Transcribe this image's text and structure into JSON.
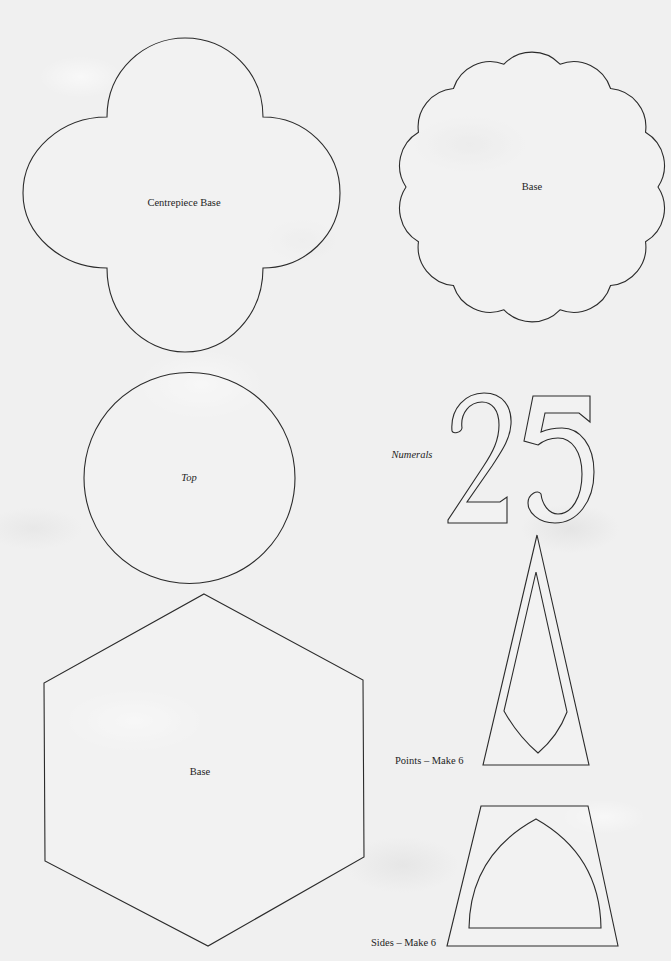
{
  "sheet": {
    "background_color": "#f0f0f0",
    "stroke_color": "#2b2b2b",
    "templates": [
      {
        "id": "centrepiece-base",
        "shape": "quatrefoil",
        "label": "Centrepiece Base"
      },
      {
        "id": "scalloped-base",
        "shape": "scalloped-circle",
        "scallops": 14,
        "label": "Base"
      },
      {
        "id": "top",
        "shape": "circle",
        "label": "Top"
      },
      {
        "id": "numerals",
        "shape": "numerals-outline",
        "digits": "25",
        "label": "Numerals"
      },
      {
        "id": "hexagon-base",
        "shape": "hexagon",
        "label": "Base"
      },
      {
        "id": "points",
        "shape": "triangle-with-cutout",
        "label": "Points – Make 6"
      },
      {
        "id": "sides",
        "shape": "trapezoid-with-arch-cutout",
        "label": "Sides – Make 6"
      }
    ]
  }
}
